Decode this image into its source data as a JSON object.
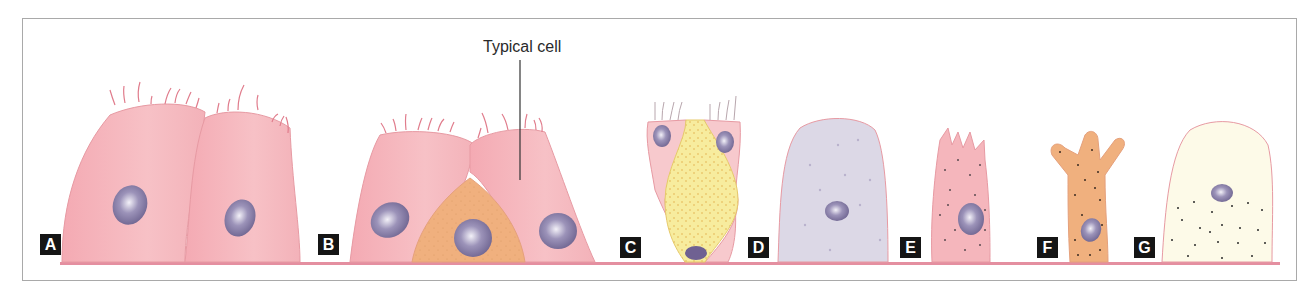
{
  "figure": {
    "callout_label": "Typical cell",
    "panels": [
      {
        "letter": "A",
        "description": "two ciliated tall cells"
      },
      {
        "letter": "B",
        "description": "ciliated cells with central typical cell"
      },
      {
        "letter": "C",
        "description": "ciliated cells flanking granular goblet-like cell"
      },
      {
        "letter": "D",
        "description": "lavender dome cell with sparse dots"
      },
      {
        "letter": "E",
        "description": "pink cell with finger-like apical processes, dotted"
      },
      {
        "letter": "F",
        "description": "orange branched cell, dotted"
      },
      {
        "letter": "G",
        "description": "cream dome cell with basal granules"
      }
    ]
  },
  "colors": {
    "basement_membrane": "#e48fa0",
    "cell_pink": "#f5b6bc",
    "cell_pink_outline": "#e79aa3",
    "cell_orange": "#f0b07e",
    "cell_yellow": "#f7ec9e",
    "cell_lavender": "#dcd8e6",
    "cell_cream": "#fdfae8",
    "nucleus": "#8e84ab",
    "label_bg": "#151515",
    "frame_border": "#a9a9a9"
  }
}
